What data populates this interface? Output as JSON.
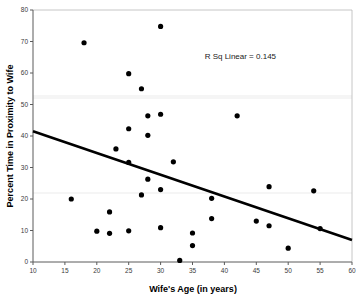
{
  "chart_data": {
    "type": "scatter",
    "title": "",
    "xlabel": "Wife's Age (in years)",
    "ylabel": "Percent Time in Proximity to Wife",
    "xlim": [
      10,
      60
    ],
    "ylim": [
      0,
      80
    ],
    "xticks": [
      10,
      15,
      20,
      25,
      30,
      35,
      40,
      45,
      50,
      55,
      60
    ],
    "yticks": [
      0,
      10,
      20,
      30,
      40,
      50,
      60,
      70,
      80
    ],
    "xtick_labels": [
      "10",
      "15",
      "20",
      "25",
      "30",
      "35",
      "40",
      "45",
      "50",
      "55",
      "60"
    ],
    "ytick_labels": [
      "0",
      "10",
      "20",
      "30",
      "40",
      "50",
      "60",
      "70",
      "80"
    ],
    "grid": false,
    "legend": "none",
    "annotations": [
      {
        "text": "R Sq Linear = 0.145",
        "x": 42.5,
        "y": 64.5
      }
    ],
    "series": [
      {
        "name": "Couples",
        "marker": "circle",
        "color": "#000000",
        "points": [
          {
            "x": 16,
            "y": 20.0
          },
          {
            "x": 18,
            "y": 69.6
          },
          {
            "x": 20,
            "y": 9.8
          },
          {
            "x": 22,
            "y": 15.9
          },
          {
            "x": 22,
            "y": 9.1
          },
          {
            "x": 23,
            "y": 35.9
          },
          {
            "x": 25,
            "y": 59.8
          },
          {
            "x": 25,
            "y": 42.3
          },
          {
            "x": 25,
            "y": 31.6
          },
          {
            "x": 25,
            "y": 9.9
          },
          {
            "x": 27,
            "y": 55.0
          },
          {
            "x": 27,
            "y": 21.3
          },
          {
            "x": 28,
            "y": 46.4
          },
          {
            "x": 28,
            "y": 40.2
          },
          {
            "x": 28,
            "y": 26.3
          },
          {
            "x": 30,
            "y": 74.8
          },
          {
            "x": 30,
            "y": 46.9
          },
          {
            "x": 30,
            "y": 23.0
          },
          {
            "x": 30,
            "y": 10.9
          },
          {
            "x": 32,
            "y": 31.8
          },
          {
            "x": 33,
            "y": 0.5
          },
          {
            "x": 35,
            "y": 9.2
          },
          {
            "x": 35,
            "y": 5.2
          },
          {
            "x": 38,
            "y": 20.2
          },
          {
            "x": 38,
            "y": 13.8
          },
          {
            "x": 42,
            "y": 46.4
          },
          {
            "x": 45,
            "y": 13.0
          },
          {
            "x": 47,
            "y": 23.9
          },
          {
            "x": 47,
            "y": 11.5
          },
          {
            "x": 50,
            "y": 4.4
          },
          {
            "x": 54,
            "y": 22.6
          },
          {
            "x": 55,
            "y": 10.6
          }
        ]
      }
    ],
    "fit_line": {
      "type": "linear",
      "r_squared": 0.145,
      "x_start": 10,
      "y_start": 41.5,
      "x_end": 60,
      "y_end": 7.0
    }
  }
}
